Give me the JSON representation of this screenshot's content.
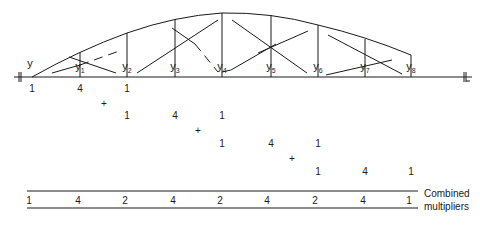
{
  "diagram": {
    "axis_label": "y",
    "centerline_symbol": "℄",
    "ordinates": [
      {
        "name": "y",
        "sub": "1"
      },
      {
        "name": "y",
        "sub": "2"
      },
      {
        "name": "y",
        "sub": "3"
      },
      {
        "name": "y",
        "sub": "4"
      },
      {
        "name": "y",
        "sub": "5"
      },
      {
        "name": "y",
        "sub": "6"
      },
      {
        "name": "y",
        "sub": "7"
      },
      {
        "name": "y",
        "sub": "8"
      }
    ],
    "simpson_groups": [
      [
        "1",
        "4",
        "1"
      ],
      [
        "1",
        "4",
        "1"
      ],
      [
        "1",
        "4",
        "1"
      ],
      [
        "1",
        "4",
        "1"
      ]
    ],
    "plus_symbol": "+",
    "combined_multipliers": [
      "1",
      "4",
      "2",
      "4",
      "2",
      "4",
      "2",
      "4",
      "1"
    ],
    "combined_label_line1": "Combined",
    "combined_label_line2": "multipliers",
    "colors": {
      "ink": "#1a1a1a",
      "background": "#ffffff"
    }
  }
}
